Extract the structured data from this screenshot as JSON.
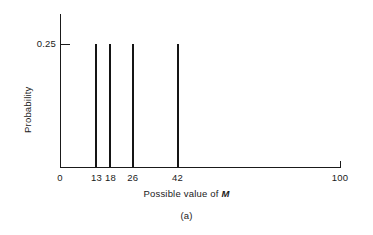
{
  "chart_data": {
    "type": "bar",
    "title": "",
    "subtitle": "",
    "caption": "(a)",
    "xlabel_prefix": "Possible value of ",
    "xlabel_variable": "M",
    "ylabel": "Probability",
    "categories": [
      "13",
      "18",
      "26",
      "42"
    ],
    "values": [
      0.25,
      0.25,
      0.25,
      0.25
    ],
    "x": [
      13,
      18,
      26,
      42
    ],
    "xlim": [
      0,
      100
    ],
    "ylim": [
      0,
      0.3
    ],
    "xticks": [
      {
        "value": 0,
        "label": "0"
      },
      {
        "value": 13,
        "label": "13"
      },
      {
        "value": 18,
        "label": "18"
      },
      {
        "value": 26,
        "label": "26"
      },
      {
        "value": 42,
        "label": "42"
      },
      {
        "value": 100,
        "label": "100"
      }
    ],
    "yticks": [
      {
        "value": 0.25,
        "label": "0.25"
      }
    ],
    "grid": false,
    "legend": null,
    "series": [
      {
        "name": "Probability of M",
        "values": [
          0.25,
          0.25,
          0.25,
          0.25
        ]
      }
    ],
    "bar_color": "#151515",
    "axis_color": "#1a1a1a"
  },
  "geometry": {
    "plot_left": 60,
    "plot_right": 340,
    "baseline_y": 167,
    "axis_top_y": 14,
    "tick_025_y": 44
  }
}
